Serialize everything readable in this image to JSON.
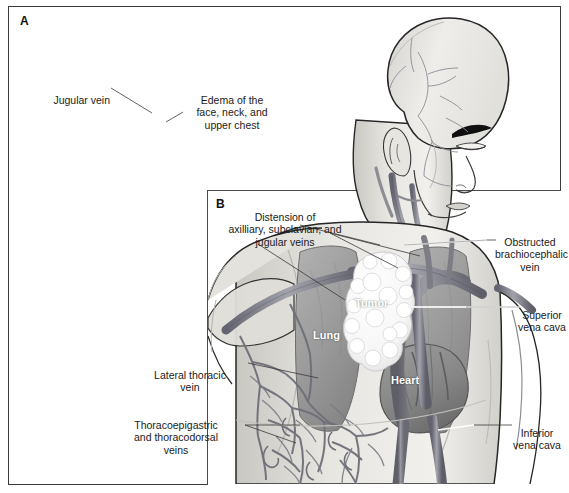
{
  "figure": {
    "title_visible": false,
    "background": "#ffffff",
    "border_color": "#3b3b3b"
  },
  "panels": [
    {
      "id": "A",
      "letter": "A",
      "description": "external view of man showing edema and distended superficial veins"
    },
    {
      "id": "B",
      "letter": "B",
      "description": "cutaway anatomical view of thorax showing tumor compressing superior vena cava"
    }
  ],
  "panel_a": {
    "letter": "A",
    "callouts": [
      {
        "name": "jugular-vein",
        "text": "Jugular vein",
        "align": "right"
      },
      {
        "name": "edema",
        "text": "Edema of the\nface, neck, and\nupper chest",
        "align": "center"
      }
    ]
  },
  "panel_b": {
    "letter": "B",
    "callouts": [
      {
        "name": "distension",
        "text": "Distension of\naxilliary, subclavian, and\njugular veins",
        "align": "center"
      },
      {
        "name": "obstructed-brachiocephalic-vein",
        "text": "Obstructed\nbrachiocephalic\nvein",
        "align": "center"
      },
      {
        "name": "superior-vena-cava",
        "text": "Superior\nvena cava",
        "align": "center"
      },
      {
        "name": "inferior-vena-cava",
        "text": "Inferior\nvena cava",
        "align": "center"
      },
      {
        "name": "lateral-thoracic-vein",
        "text": "Lateral thoracic\nvein",
        "align": "center"
      },
      {
        "name": "thoracoepigastric",
        "text": "Thoracoepigastric\nand thoracodorsal\nveins",
        "align": "center"
      }
    ],
    "organ_labels": [
      {
        "name": "tumor",
        "text": "Tumor"
      },
      {
        "name": "lung",
        "text": "Lung"
      },
      {
        "name": "heart",
        "text": "Heart"
      }
    ]
  },
  "colors": {
    "skin_light": "#f0efec",
    "skin_mid": "#dddbd6",
    "skin_shade": "#c6c4bf",
    "outline": "#2b2b2b",
    "vein": "#8f8f96",
    "vein_dark": "#6e6e77",
    "vessel_big": "#8a8a92",
    "vessel_big_dark": "#63636c",
    "lung": "#a7a7a7",
    "lung_dark": "#8d8d8d",
    "heart": "#919191",
    "tumor": "#fbfbfb",
    "label_text": "#1a1a1a",
    "inlabel_text": "#ffffff",
    "panel_border": "#4a4a4a"
  }
}
